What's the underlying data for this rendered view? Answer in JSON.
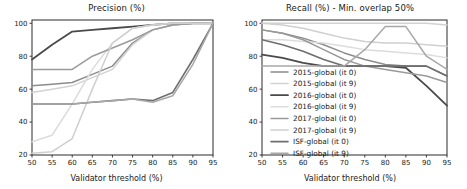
{
  "figure": {
    "width": 467,
    "height": 189,
    "background": "#ffffff"
  },
  "series_styles": [
    {
      "name": "2015-global (it 0)",
      "color": "#8c8c8c",
      "width": 1.5
    },
    {
      "name": "2015-global (it 9)",
      "color": "#d2d2d2",
      "width": 1.5
    },
    {
      "name": "2016-global (it 0)",
      "color": "#4a4a4a",
      "width": 1.8
    },
    {
      "name": "2016-global (it 9)",
      "color": "#dcdcdc",
      "width": 1.5
    },
    {
      "name": "2017-global (it 0)",
      "color": "#9a9a9a",
      "width": 1.5
    },
    {
      "name": "2017-global (it 9)",
      "color": "#cfcfcf",
      "width": 1.5
    },
    {
      "name": "ISF-global (it 0)",
      "color": "#6e6e6e",
      "width": 1.6
    },
    {
      "name": "ISF-global (it 9)",
      "color": "#a8a8a8",
      "width": 1.5
    }
  ],
  "legend": {
    "position": "center-left",
    "entries": [
      "2015-global (it 0)",
      "2015-global (it 9)",
      "2016-global (it 0)",
      "2016-global (it 9)",
      "2017-global (it 0)",
      "2017-global (it 9)",
      "ISF-global (it 0)",
      "ISF-global (it 9)"
    ]
  },
  "chart_data": [
    {
      "id": "precision",
      "type": "line",
      "title": "Precision (%)",
      "xlabel": "Validator threshold (%)",
      "ylabel": "",
      "xlim": [
        50,
        95
      ],
      "ylim": [
        20,
        102
      ],
      "xticks": [
        50,
        55,
        60,
        65,
        70,
        75,
        80,
        85,
        90,
        95
      ],
      "yticks": [
        20,
        40,
        60,
        80,
        100
      ],
      "grid": false,
      "legend": false,
      "x": [
        50,
        55,
        60,
        65,
        70,
        75,
        80,
        85,
        90,
        95
      ],
      "series": [
        {
          "name": "2015-global (it 0)",
          "values": [
            62,
            63,
            64,
            69,
            74,
            88,
            96,
            99,
            100,
            100
          ]
        },
        {
          "name": "2015-global (it 9)",
          "values": [
            58,
            60,
            62,
            67,
            72,
            87,
            96,
            99,
            100,
            100
          ]
        },
        {
          "name": "2016-global (it 0)",
          "values": [
            78,
            87,
            95,
            96,
            97,
            98,
            99,
            100,
            100,
            100
          ]
        },
        {
          "name": "2016-global (it 9)",
          "values": [
            28,
            32,
            51,
            72,
            88,
            97,
            99,
            100,
            100,
            100
          ]
        },
        {
          "name": "2017-global (it 0)",
          "values": [
            72,
            72,
            72,
            80,
            85,
            90,
            96,
            99,
            100,
            100
          ]
        },
        {
          "name": "2017-global (it 9)",
          "values": [
            21,
            22,
            30,
            60,
            88,
            97,
            99,
            100,
            100,
            100
          ]
        },
        {
          "name": "ISF-global (it 0)",
          "values": [
            51,
            51,
            51,
            52,
            53,
            54,
            53,
            58,
            78,
            100
          ]
        },
        {
          "name": "ISF-global (it 9)",
          "values": [
            51,
            51,
            51,
            52,
            53,
            54,
            52,
            56,
            75,
            100
          ]
        }
      ]
    },
    {
      "id": "recall",
      "type": "line",
      "title": "Recall (%) - Min. overlap 50%",
      "xlabel": "Validator threshold (%)",
      "ylabel": "",
      "xlim": [
        50,
        95
      ],
      "ylim": [
        20,
        102
      ],
      "xticks": [
        50,
        55,
        60,
        65,
        70,
        75,
        80,
        85,
        90,
        95
      ],
      "yticks": [
        20,
        40,
        60,
        80,
        100
      ],
      "grid": false,
      "legend": true,
      "x": [
        50,
        55,
        60,
        65,
        70,
        75,
        80,
        85,
        90,
        95
      ],
      "series": [
        {
          "name": "2015-global (it 0)",
          "values": [
            96,
            94,
            91,
            87,
            82,
            78,
            75,
            74,
            74,
            68
          ]
        },
        {
          "name": "2015-global (it 9)",
          "values": [
            100,
            100,
            100,
            100,
            100,
            100,
            100,
            100,
            100,
            99
          ]
        },
        {
          "name": "2016-global (it 0)",
          "values": [
            81,
            79,
            76,
            74,
            74,
            74,
            74,
            73,
            62,
            50
          ]
        },
        {
          "name": "2016-global (it 9)",
          "values": [
            90,
            90,
            89,
            88,
            86,
            84,
            83,
            82,
            81,
            79
          ]
        },
        {
          "name": "2017-global (it 0)",
          "values": [
            96,
            94,
            90,
            84,
            78,
            74,
            72,
            70,
            68,
            64
          ]
        },
        {
          "name": "2017-global (it 9)",
          "values": [
            100,
            99,
            97,
            94,
            91,
            89,
            88,
            88,
            87,
            86
          ]
        },
        {
          "name": "ISF-global (it 0)",
          "values": [
            90,
            87,
            83,
            78,
            74,
            74,
            74,
            74,
            74,
            68
          ]
        },
        {
          "name": "ISF-global (it 9)",
          "values": [
            74,
            74,
            74,
            74,
            74,
            84,
            98,
            98,
            80,
            72
          ]
        }
      ]
    }
  ]
}
